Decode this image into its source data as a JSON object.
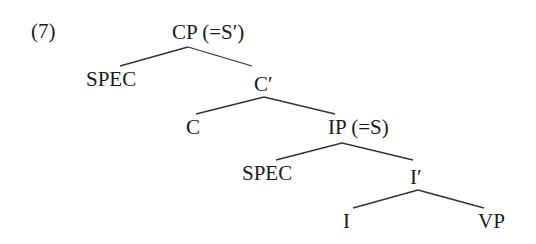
{
  "example_number": "(7)",
  "tree": {
    "nodes": {
      "cp": "CP (=S′)",
      "spec_cp": "SPEC",
      "c_bar": "C′",
      "c": "C",
      "ip": "IP (=S)",
      "spec_ip": "SPEC",
      "i_bar": "I′",
      "i": "I",
      "vp": "VP"
    },
    "edges": [
      [
        "CP",
        "SPEC"
      ],
      [
        "CP",
        "C′"
      ],
      [
        "C′",
        "C"
      ],
      [
        "C′",
        "IP"
      ],
      [
        "IP",
        "SPEC"
      ],
      [
        "IP",
        "I′"
      ],
      [
        "I′",
        "I"
      ],
      [
        "I′",
        "VP"
      ]
    ]
  },
  "colors": {
    "text": "#1a1a1a",
    "lines": "#333333",
    "background": "#ffffff"
  }
}
